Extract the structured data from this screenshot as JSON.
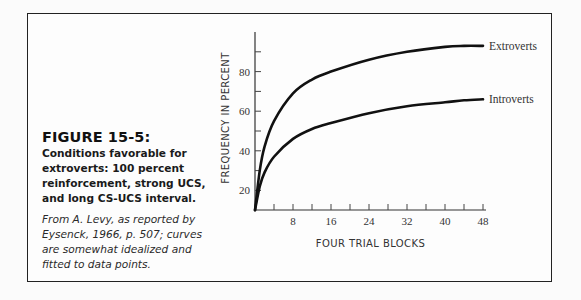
{
  "figure": {
    "title": "FIGURE 15-5:",
    "description": "Conditions favorable for extroverts: 100 percent reinforcement, strong UCS, and long CS-UCS interval.",
    "source": "From A. Levy, as reported by Eysenck, 1966, p. 507; curves are somewhat idealized and fitted to data points."
  },
  "chart_data": {
    "type": "line",
    "title": "",
    "xlabel": "FOUR TRIAL BLOCKS",
    "ylabel": "FREQUENCY IN PERCENT",
    "xlim": [
      0,
      48
    ],
    "ylim": [
      10,
      100
    ],
    "x_ticks": [
      8,
      16,
      24,
      32,
      40,
      48
    ],
    "x_minor_ticks": [
      4,
      12,
      20,
      28,
      36,
      44
    ],
    "y_ticks": [
      20,
      40,
      60,
      80
    ],
    "y_minor_ticks": [
      30,
      50,
      70,
      90
    ],
    "grid": false,
    "legend_position": "inline-right",
    "series": [
      {
        "name": "Extroverts",
        "x": [
          0,
          1,
          2,
          4,
          8,
          12,
          16,
          24,
          32,
          40,
          44,
          48
        ],
        "values": [
          10,
          30,
          42,
          55,
          69,
          76,
          80,
          86,
          90,
          92.5,
          93,
          93
        ]
      },
      {
        "name": "Introverts",
        "x": [
          0,
          1,
          2,
          4,
          8,
          12,
          16,
          24,
          32,
          40,
          44,
          48
        ],
        "values": [
          10,
          22,
          29,
          37,
          46,
          51,
          54,
          59,
          62.5,
          64.5,
          65.5,
          66
        ]
      }
    ]
  }
}
